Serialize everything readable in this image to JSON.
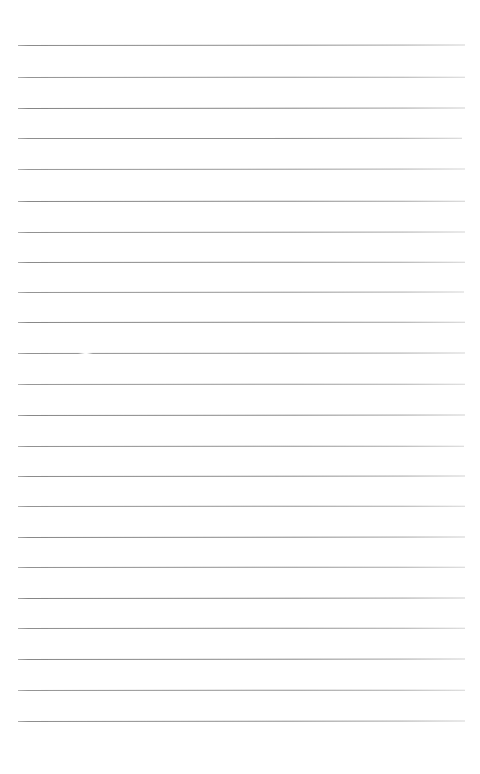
{
  "document": {
    "kind": "lined-paper",
    "title": "Blank Ruled Paper",
    "description": "A blank sheet of ruled writing paper with evenly spaced horizontal lines and no written content.",
    "page_width": 480,
    "page_height": 774,
    "background_color": "#ffffff",
    "content_text": ""
  },
  "ruling": {
    "line_color": "#6b6b6b",
    "line_thickness": 1,
    "line_count": 23,
    "first_line_y": 45,
    "line_spacing": 30.5,
    "left_margin_x": 18,
    "right_margin_x": 465,
    "lines": [
      {
        "index": 1,
        "y": 45,
        "x1": 18,
        "x2": 465,
        "opacity": 0.78,
        "tilt": -0.05
      },
      {
        "index": 2,
        "y": 77,
        "x1": 18,
        "x2": 465,
        "opacity": 0.72,
        "tilt": -0.04
      },
      {
        "index": 3,
        "y": 108,
        "x1": 18,
        "x2": 465,
        "opacity": 0.82,
        "tilt": -0.05
      },
      {
        "index": 4,
        "y": 138,
        "x1": 18,
        "x2": 462,
        "opacity": 0.76,
        "tilt": -0.03
      },
      {
        "index": 5,
        "y": 169,
        "x1": 18,
        "x2": 465,
        "opacity": 0.7,
        "tilt": -0.05
      },
      {
        "index": 6,
        "y": 201,
        "x1": 18,
        "x2": 465,
        "opacity": 0.8,
        "tilt": -0.04
      },
      {
        "index": 7,
        "y": 232,
        "x1": 18,
        "x2": 465,
        "opacity": 0.74,
        "tilt": -0.05
      },
      {
        "index": 8,
        "y": 262,
        "x1": 18,
        "x2": 465,
        "opacity": 0.78,
        "tilt": -0.04
      },
      {
        "index": 9,
        "y": 292,
        "x1": 18,
        "x2": 464,
        "opacity": 0.72,
        "tilt": -0.05
      },
      {
        "index": 10,
        "y": 322,
        "x1": 18,
        "x2": 465,
        "opacity": 0.8,
        "tilt": -0.04
      },
      {
        "index": 11,
        "y": 353,
        "x1": 18,
        "x2": 465,
        "opacity": 0.74,
        "tilt": -0.05
      },
      {
        "index": 12,
        "y": 384,
        "x1": 18,
        "x2": 465,
        "opacity": 0.7,
        "tilt": -0.04
      },
      {
        "index": 13,
        "y": 415,
        "x1": 18,
        "x2": 465,
        "opacity": 0.8,
        "tilt": -0.05
      },
      {
        "index": 14,
        "y": 446,
        "x1": 18,
        "x2": 464,
        "opacity": 0.74,
        "tilt": -0.04
      },
      {
        "index": 15,
        "y": 476,
        "x1": 18,
        "x2": 465,
        "opacity": 0.78,
        "tilt": -0.05
      },
      {
        "index": 16,
        "y": 506,
        "x1": 18,
        "x2": 465,
        "opacity": 0.72,
        "tilt": -0.04
      },
      {
        "index": 17,
        "y": 537,
        "x1": 18,
        "x2": 465,
        "opacity": 0.8,
        "tilt": -0.05
      },
      {
        "index": 18,
        "y": 567,
        "x1": 18,
        "x2": 465,
        "opacity": 0.74,
        "tilt": -0.04
      },
      {
        "index": 19,
        "y": 598,
        "x1": 18,
        "x2": 465,
        "opacity": 0.82,
        "tilt": -0.05
      },
      {
        "index": 20,
        "y": 628,
        "x1": 18,
        "x2": 465,
        "opacity": 0.76,
        "tilt": -0.04
      },
      {
        "index": 21,
        "y": 659,
        "x1": 18,
        "x2": 465,
        "opacity": 0.8,
        "tilt": -0.05
      },
      {
        "index": 22,
        "y": 690,
        "x1": 18,
        "x2": 465,
        "opacity": 0.72,
        "tilt": -0.04
      },
      {
        "index": 23,
        "y": 721,
        "x1": 18,
        "x2": 465,
        "opacity": 0.76,
        "tilt": -0.05
      }
    ],
    "breaks": [
      {
        "line_index": 11,
        "y": 352,
        "x1": 78,
        "x2": 93
      }
    ]
  },
  "margins": {
    "top_blank_height": 45,
    "bottom_blank_height": 53,
    "left_blank_width": 18,
    "right_blank_width": 15
  }
}
